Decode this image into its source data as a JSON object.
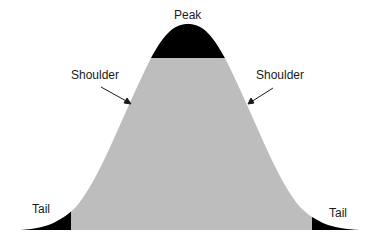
{
  "diagram": {
    "type": "normal-distribution-regions",
    "labels": {
      "peak": "Peak",
      "shoulder_left": "Shoulder",
      "shoulder_right": "Shoulder",
      "tail_left": "Tail",
      "tail_right": "Tail"
    },
    "colors": {
      "body": "#bdbdbd",
      "peak": "#000000",
      "tails": "#000000",
      "text": "#1a1a1a",
      "background": "#ffffff"
    }
  }
}
